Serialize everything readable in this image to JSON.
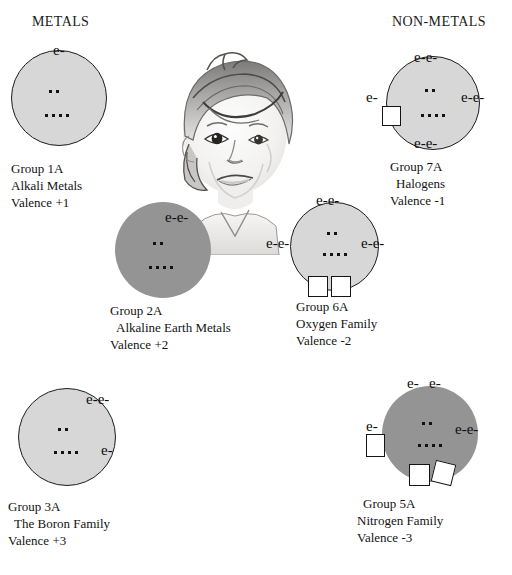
{
  "headings": {
    "metals": "METALS",
    "nonmetals": "NON-METALS"
  },
  "illustration": {
    "name": "child-face-pencil-sketch",
    "description": "Pencil sketch drawing of a child's face"
  },
  "core_dots": {
    "upper_row_count": 2,
    "lower_row_count": 4
  },
  "colors": {
    "shell_light": "#d7d7d7",
    "shell_dark": "#949494",
    "outline": "#1d1d1d",
    "text": "#131313",
    "background": "#ffffff"
  },
  "groups": [
    {
      "id": "group-1a",
      "group": "Group 1A",
      "family": "Alkali Metals",
      "valence": "Valence  +1",
      "shell_style": "light",
      "electron_labels": [
        {
          "text": "e-",
          "position": "top"
        }
      ],
      "empty_slots": 0
    },
    {
      "id": "group-2a",
      "group": "Group 2A",
      "family": "Alkaline Earth Metals",
      "valence": "Valence +2",
      "shell_style": "dark",
      "electron_labels": [
        {
          "text": "e-e-",
          "position": "top-right"
        }
      ],
      "empty_slots": 0
    },
    {
      "id": "group-3a",
      "group": "Group 3A",
      "family": "The Boron Family",
      "valence": "Valence  +3",
      "shell_style": "light",
      "electron_labels": [
        {
          "text": "e-e-",
          "position": "upper-right"
        },
        {
          "text": "e-",
          "position": "lower-right"
        }
      ],
      "empty_slots": 0
    },
    {
      "id": "group-5a",
      "group": "Group 5A",
      "family": "Nitrogen Family",
      "valence": "Valence  -3",
      "shell_style": "dark",
      "electron_labels": [
        {
          "text": "e-",
          "position": "top-left"
        },
        {
          "text": "e-",
          "position": "top-right"
        },
        {
          "text": "e-",
          "position": "left"
        },
        {
          "text": "e-e-",
          "position": "right"
        }
      ],
      "empty_slots": 3
    },
    {
      "id": "group-6a",
      "group": "Group 6A",
      "family": "Oxygen Family",
      "valence": "Valence  -2",
      "shell_style": "light",
      "electron_labels": [
        {
          "text": "e-e-",
          "position": "top"
        },
        {
          "text": "e-e-",
          "position": "left"
        },
        {
          "text": "e-e-",
          "position": "right"
        }
      ],
      "empty_slots": 2
    },
    {
      "id": "group-7a",
      "group": "Group 7A",
      "family": "Halogens",
      "valence": "Valence  -1",
      "shell_style": "light",
      "electron_labels": [
        {
          "text": "e-e-",
          "position": "top"
        },
        {
          "text": "e-",
          "position": "left"
        },
        {
          "text": "e-e-",
          "position": "right"
        },
        {
          "text": "e-e-",
          "position": "bottom"
        }
      ],
      "empty_slots": 1
    }
  ]
}
